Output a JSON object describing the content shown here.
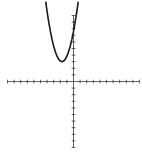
{
  "chart_data": {
    "type": "line",
    "title": "",
    "xlabel": "",
    "ylabel": "",
    "xlim": [
      -10,
      10
    ],
    "ylim": [
      -10,
      10
    ],
    "grid": false,
    "legend": null,
    "tick_step": 1,
    "tick_labels": false,
    "series": [
      {
        "name": "parabola",
        "equation": "y = 1.5(x + 1.75)^2 + 3",
        "vertex": [
          -1.75,
          3
        ],
        "x": [
          -4.2,
          -4.0,
          -3.75,
          -3.5,
          -3.25,
          -3.0,
          -2.75,
          -2.5,
          -2.25,
          -2.0,
          -1.75,
          -1.5,
          -1.25,
          -1.0,
          -0.75,
          -0.5,
          -0.25,
          0.0,
          0.25,
          0.5,
          0.7
        ],
        "y": [
          12.0,
          10.59,
          9.0,
          7.59,
          6.38,
          5.34,
          4.5,
          3.84,
          3.38,
          3.09,
          3.0,
          3.09,
          3.38,
          3.84,
          4.5,
          5.34,
          6.38,
          7.59,
          9.0,
          10.59,
          12.0
        ]
      }
    ]
  },
  "layout": {
    "origin_px": [
      73.5,
      81.5
    ],
    "unit_px": 6.6,
    "curve_color": "#1a1a1a",
    "axis_color": "#3a3a3a",
    "background": "#ffffff"
  },
  "labels": {
    "figure_name": "Graph of a parabola opening upward with vertex left of the y-axis"
  }
}
